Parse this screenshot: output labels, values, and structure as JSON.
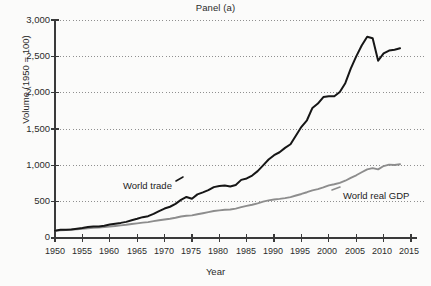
{
  "chart": {
    "title": "Panel (a)",
    "xlabel": "Year",
    "ylabel": "Volume (1950 = 100)",
    "ytick_labels": [
      "3,000",
      "2,500",
      "2,000",
      "1,500",
      "1,000",
      "500",
      "0"
    ],
    "xtick_labels": [
      "1950",
      "1955",
      "1960",
      "1965",
      "1970",
      "1975",
      "1980",
      "1985",
      "1990",
      "1995",
      "2000",
      "2005",
      "2010",
      "2015"
    ],
    "series_labels": {
      "world_trade": "World trade",
      "world_real_gdp": "World real GDP"
    },
    "colors": {
      "world_trade": "#161616",
      "world_real_gdp": "#8d8d8d",
      "axis": "#3a3a3a",
      "grid": "#8f8f8f",
      "background": "#fbfbfa",
      "text": "#2b2b2b"
    }
  },
  "chart_data": {
    "type": "line",
    "title": "Panel (a)",
    "subtitle": "",
    "xlabel": "Year",
    "ylabel": "Volume (1950 = 100)",
    "xlim": [
      1950,
      2015
    ],
    "ylim": [
      0,
      3000
    ],
    "yticks": [
      0,
      500,
      1000,
      1500,
      2000,
      2500,
      3000
    ],
    "ytick_labels": [
      "0",
      "500",
      "1,000",
      "1,500",
      "2,000",
      "2,500",
      "3,000"
    ],
    "xticks": [
      1950,
      1955,
      1960,
      1965,
      1970,
      1975,
      1980,
      1985,
      1990,
      1995,
      2000,
      2005,
      2010,
      2015
    ],
    "grid": "horizontal-dotted",
    "legend": "inline-annotations",
    "annotations": [
      {
        "text": "World trade",
        "series": "World trade",
        "x": 1971,
        "y": 700
      },
      {
        "text": "World real GDP",
        "series": "World real GDP",
        "x": 2006,
        "y": 560
      }
    ],
    "x": [
      1950,
      1951,
      1952,
      1953,
      1954,
      1955,
      1956,
      1957,
      1958,
      1959,
      1960,
      1961,
      1962,
      1963,
      1964,
      1965,
      1966,
      1967,
      1968,
      1969,
      1970,
      1971,
      1972,
      1973,
      1974,
      1975,
      1976,
      1977,
      1978,
      1979,
      1980,
      1981,
      1982,
      1983,
      1984,
      1985,
      1986,
      1987,
      1988,
      1989,
      1990,
      1991,
      1992,
      1993,
      1994,
      1995,
      1996,
      1997,
      1998,
      1999,
      2000,
      2001,
      2002,
      2003,
      2004,
      2005,
      2006,
      2007,
      2008,
      2009,
      2010,
      2011,
      2012,
      2013
    ],
    "series": [
      {
        "name": "World trade",
        "color": "#161616",
        "values": [
          100,
          112,
          113,
          118,
          127,
          137,
          150,
          158,
          157,
          168,
          185,
          196,
          208,
          222,
          244,
          264,
          287,
          300,
          333,
          371,
          405,
          430,
          470,
          525,
          565,
          540,
          600,
          628,
          658,
          700,
          715,
          722,
          710,
          730,
          800,
          820,
          860,
          920,
          1000,
          1080,
          1140,
          1180,
          1240,
          1290,
          1410,
          1530,
          1620,
          1790,
          1850,
          1940,
          1950,
          1950,
          2010,
          2130,
          2330,
          2500,
          2650,
          2770,
          2750,
          2440,
          2540,
          2580,
          2590,
          2610
        ]
      },
      {
        "name": "World real GDP",
        "color": "#8d8d8d",
        "values": [
          100,
          105,
          110,
          116,
          121,
          128,
          134,
          140,
          144,
          152,
          159,
          166,
          174,
          182,
          192,
          202,
          212,
          219,
          232,
          244,
          255,
          265,
          279,
          296,
          306,
          311,
          327,
          341,
          356,
          372,
          380,
          388,
          392,
          404,
          424,
          442,
          458,
          477,
          500,
          518,
          530,
          538,
          549,
          563,
          585,
          606,
          630,
          656,
          672,
          696,
          725,
          740,
          758,
          788,
          827,
          863,
          905,
          945,
          962,
          944,
          990,
          1010,
          1005,
          1015
        ]
      }
    ]
  }
}
